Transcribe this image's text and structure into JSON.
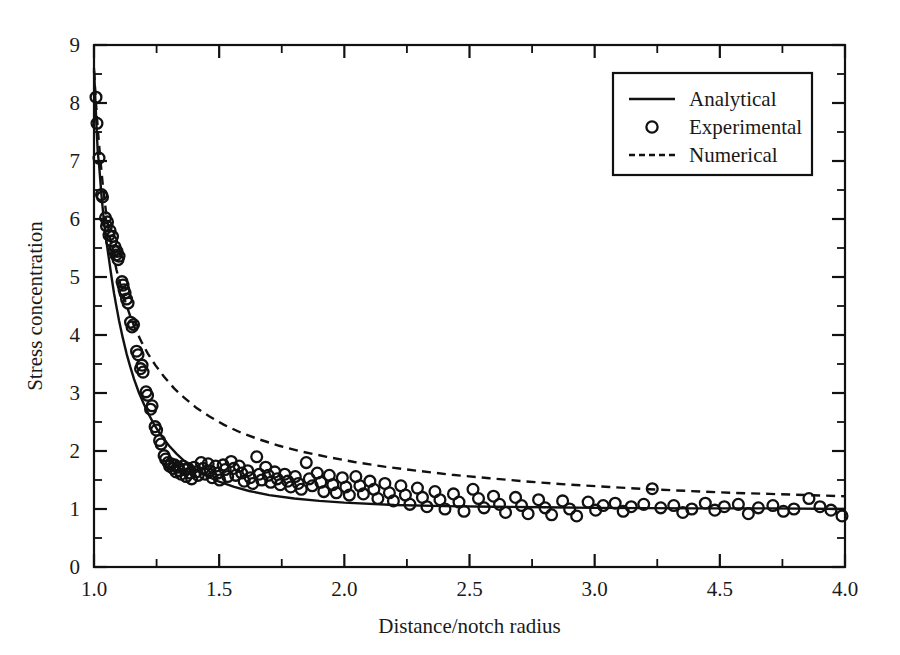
{
  "figure": {
    "background_color": "#ffffff",
    "ink_color": "#111111"
  },
  "chart_data": {
    "type": "scatter",
    "title": "",
    "subtitle": "",
    "xlabel": "Distance/notch radius",
    "ylabel": "Stress concentration",
    "xlim": [
      1.0,
      4.0
    ],
    "ylim": [
      0,
      9
    ],
    "grid": false,
    "legend_position": "top-right",
    "x_ticks": [
      1.0,
      1.5,
      2.0,
      2.5,
      3.0,
      3.5,
      4.0
    ],
    "x_tick_labels": [
      "1.0",
      "1.5",
      "2.0",
      "2.5",
      "3.0",
      "4.5",
      "4.0"
    ],
    "x_minor_tick_step": 0.25,
    "y_ticks": [
      0,
      1,
      2,
      3,
      4,
      5,
      6,
      7,
      8,
      9
    ],
    "y_tick_labels": [
      "0",
      "1",
      "2",
      "3",
      "4",
      "5",
      "6",
      "7",
      "8",
      "9"
    ],
    "y_minor_tick_step": 0.5,
    "annotations": [
      "X tick label at position 3.5 is printed as 4.5 in the original figure"
    ],
    "series": [
      {
        "name": "Analytical",
        "style": "solid-line",
        "marker": "none",
        "asymptote": 1.0,
        "points": [
          [
            1.0,
            8.6
          ],
          [
            1.005,
            8.1
          ],
          [
            1.01,
            7.6
          ],
          [
            1.015,
            7.15
          ],
          [
            1.02,
            6.95
          ],
          [
            1.03,
            6.4
          ],
          [
            1.04,
            5.95
          ],
          [
            1.05,
            5.6
          ],
          [
            1.06,
            5.3
          ],
          [
            1.07,
            5.0
          ],
          [
            1.08,
            4.72
          ],
          [
            1.09,
            4.48
          ],
          [
            1.1,
            4.25
          ],
          [
            1.115,
            3.95
          ],
          [
            1.13,
            3.68
          ],
          [
            1.145,
            3.45
          ],
          [
            1.16,
            3.24
          ],
          [
            1.18,
            3.0
          ],
          [
            1.2,
            2.8
          ],
          [
            1.22,
            2.62
          ],
          [
            1.24,
            2.46
          ],
          [
            1.26,
            2.32
          ],
          [
            1.28,
            2.2
          ],
          [
            1.3,
            2.09
          ],
          [
            1.33,
            1.95
          ],
          [
            1.36,
            1.83
          ],
          [
            1.4,
            1.7
          ],
          [
            1.45,
            1.57
          ],
          [
            1.5,
            1.47
          ],
          [
            1.56,
            1.38
          ],
          [
            1.62,
            1.31
          ],
          [
            1.7,
            1.24
          ],
          [
            1.8,
            1.18
          ],
          [
            1.9,
            1.14
          ],
          [
            2.0,
            1.11
          ],
          [
            2.2,
            1.07
          ],
          [
            2.4,
            1.05
          ],
          [
            2.6,
            1.04
          ],
          [
            2.8,
            1.03
          ],
          [
            3.0,
            1.02
          ],
          [
            3.4,
            1.01
          ],
          [
            3.7,
            1.01
          ],
          [
            4.0,
            1.0
          ]
        ]
      },
      {
        "name": "Numerical",
        "style": "dashed-line",
        "marker": "none",
        "asymptote": 1.2,
        "points": [
          [
            1.0,
            8.55
          ],
          [
            1.008,
            8.0
          ],
          [
            1.016,
            7.5
          ],
          [
            1.026,
            7.0
          ],
          [
            1.036,
            6.55
          ],
          [
            1.048,
            6.12
          ],
          [
            1.06,
            5.78
          ],
          [
            1.074,
            5.45
          ],
          [
            1.09,
            5.12
          ],
          [
            1.105,
            4.88
          ],
          [
            1.125,
            4.58
          ],
          [
            1.145,
            4.32
          ],
          [
            1.165,
            4.1
          ],
          [
            1.19,
            3.88
          ],
          [
            1.215,
            3.68
          ],
          [
            1.245,
            3.48
          ],
          [
            1.28,
            3.28
          ],
          [
            1.32,
            3.08
          ],
          [
            1.36,
            2.92
          ],
          [
            1.41,
            2.74
          ],
          [
            1.46,
            2.6
          ],
          [
            1.52,
            2.45
          ],
          [
            1.59,
            2.31
          ],
          [
            1.66,
            2.2
          ],
          [
            1.74,
            2.09
          ],
          [
            1.83,
            1.99
          ],
          [
            1.93,
            1.9
          ],
          [
            2.04,
            1.81
          ],
          [
            2.16,
            1.73
          ],
          [
            2.29,
            1.66
          ],
          [
            2.43,
            1.59
          ],
          [
            2.58,
            1.53
          ],
          [
            2.74,
            1.47
          ],
          [
            2.9,
            1.42
          ],
          [
            3.06,
            1.38
          ],
          [
            3.22,
            1.34
          ],
          [
            3.38,
            1.31
          ],
          [
            3.54,
            1.28
          ],
          [
            3.7,
            1.26
          ],
          [
            3.85,
            1.24
          ],
          [
            4.0,
            1.22
          ]
        ]
      },
      {
        "name": "Experimental",
        "style": "none",
        "marker": "open-circle",
        "points": [
          [
            1.008,
            8.1
          ],
          [
            1.012,
            7.65
          ],
          [
            1.02,
            7.05
          ],
          [
            1.03,
            6.42
          ],
          [
            1.034,
            6.38
          ],
          [
            1.046,
            6.02
          ],
          [
            1.05,
            5.88
          ],
          [
            1.054,
            5.95
          ],
          [
            1.06,
            5.72
          ],
          [
            1.064,
            5.8
          ],
          [
            1.07,
            5.62
          ],
          [
            1.074,
            5.7
          ],
          [
            1.08,
            5.45
          ],
          [
            1.084,
            5.52
          ],
          [
            1.088,
            5.38
          ],
          [
            1.092,
            5.44
          ],
          [
            1.096,
            5.3
          ],
          [
            1.1,
            5.36
          ],
          [
            1.112,
            4.92
          ],
          [
            1.116,
            4.86
          ],
          [
            1.12,
            4.78
          ],
          [
            1.124,
            4.72
          ],
          [
            1.13,
            4.62
          ],
          [
            1.136,
            4.55
          ],
          [
            1.146,
            4.22
          ],
          [
            1.152,
            4.14
          ],
          [
            1.158,
            4.18
          ],
          [
            1.17,
            3.72
          ],
          [
            1.176,
            3.66
          ],
          [
            1.186,
            3.42
          ],
          [
            1.192,
            3.48
          ],
          [
            1.196,
            3.36
          ],
          [
            1.208,
            3.02
          ],
          [
            1.214,
            2.96
          ],
          [
            1.226,
            2.72
          ],
          [
            1.232,
            2.78
          ],
          [
            1.244,
            2.42
          ],
          [
            1.25,
            2.36
          ],
          [
            1.262,
            2.18
          ],
          [
            1.268,
            2.12
          ],
          [
            1.28,
            1.92
          ],
          [
            1.286,
            1.86
          ],
          [
            1.296,
            1.8
          ],
          [
            1.302,
            1.74
          ],
          [
            1.308,
            1.78
          ],
          [
            1.316,
            1.7
          ],
          [
            1.322,
            1.76
          ],
          [
            1.328,
            1.64
          ],
          [
            1.336,
            1.72
          ],
          [
            1.342,
            1.66
          ],
          [
            1.348,
            1.6
          ],
          [
            1.356,
            1.74
          ],
          [
            1.362,
            1.68
          ],
          [
            1.368,
            1.56
          ],
          [
            1.376,
            1.7
          ],
          [
            1.382,
            1.62
          ],
          [
            1.39,
            1.52
          ],
          [
            1.4,
            1.72
          ],
          [
            1.408,
            1.64
          ],
          [
            1.416,
            1.58
          ],
          [
            1.428,
            1.8
          ],
          [
            1.436,
            1.7
          ],
          [
            1.444,
            1.6
          ],
          [
            1.456,
            1.78
          ],
          [
            1.464,
            1.66
          ],
          [
            1.472,
            1.54
          ],
          [
            1.486,
            1.74
          ],
          [
            1.494,
            1.62
          ],
          [
            1.502,
            1.5
          ],
          [
            1.516,
            1.76
          ],
          [
            1.524,
            1.68
          ],
          [
            1.534,
            1.56
          ],
          [
            1.548,
            1.82
          ],
          [
            1.558,
            1.7
          ],
          [
            1.566,
            1.58
          ],
          [
            1.58,
            1.74
          ],
          [
            1.59,
            1.62
          ],
          [
            1.6,
            1.48
          ],
          [
            1.614,
            1.66
          ],
          [
            1.624,
            1.54
          ],
          [
            1.634,
            1.44
          ],
          [
            1.65,
            1.9
          ],
          [
            1.66,
            1.6
          ],
          [
            1.67,
            1.5
          ],
          [
            1.686,
            1.72
          ],
          [
            1.696,
            1.58
          ],
          [
            1.706,
            1.46
          ],
          [
            1.722,
            1.64
          ],
          [
            1.732,
            1.52
          ],
          [
            1.744,
            1.42
          ],
          [
            1.762,
            1.6
          ],
          [
            1.774,
            1.48
          ],
          [
            1.786,
            1.38
          ],
          [
            1.804,
            1.56
          ],
          [
            1.816,
            1.44
          ],
          [
            1.828,
            1.34
          ],
          [
            1.848,
            1.8
          ],
          [
            1.86,
            1.52
          ],
          [
            1.872,
            1.4
          ],
          [
            1.892,
            1.62
          ],
          [
            1.906,
            1.46
          ],
          [
            1.918,
            1.3
          ],
          [
            1.94,
            1.58
          ],
          [
            1.954,
            1.42
          ],
          [
            1.968,
            1.28
          ],
          [
            1.992,
            1.54
          ],
          [
            2.006,
            1.38
          ],
          [
            2.02,
            1.24
          ],
          [
            2.046,
            1.56
          ],
          [
            2.062,
            1.4
          ],
          [
            2.076,
            1.26
          ],
          [
            2.102,
            1.48
          ],
          [
            2.118,
            1.34
          ],
          [
            2.134,
            1.18
          ],
          [
            2.162,
            1.44
          ],
          [
            2.18,
            1.28
          ],
          [
            2.196,
            1.14
          ],
          [
            2.226,
            1.4
          ],
          [
            2.244,
            1.24
          ],
          [
            2.262,
            1.08
          ],
          [
            2.292,
            1.36
          ],
          [
            2.312,
            1.2
          ],
          [
            2.33,
            1.04
          ],
          [
            2.362,
            1.3
          ],
          [
            2.382,
            1.16
          ],
          [
            2.402,
            1.0
          ],
          [
            2.436,
            1.26
          ],
          [
            2.458,
            1.12
          ],
          [
            2.478,
            0.96
          ],
          [
            2.514,
            1.34
          ],
          [
            2.536,
            1.18
          ],
          [
            2.558,
            1.02
          ],
          [
            2.596,
            1.22
          ],
          [
            2.62,
            1.08
          ],
          [
            2.644,
            0.94
          ],
          [
            2.684,
            1.2
          ],
          [
            2.708,
            1.06
          ],
          [
            2.734,
            0.92
          ],
          [
            2.776,
            1.16
          ],
          [
            2.802,
            1.02
          ],
          [
            2.828,
            0.9
          ],
          [
            2.872,
            1.14
          ],
          [
            2.9,
            1.0
          ],
          [
            2.928,
            0.88
          ],
          [
            2.974,
            1.12
          ],
          [
            3.004,
            0.98
          ],
          [
            3.034,
            1.06
          ],
          [
            3.082,
            1.1
          ],
          [
            3.114,
            0.96
          ],
          [
            3.146,
            1.04
          ],
          [
            3.196,
            1.08
          ],
          [
            3.23,
            1.35
          ],
          [
            3.264,
            1.02
          ],
          [
            3.316,
            1.06
          ],
          [
            3.352,
            0.94
          ],
          [
            3.388,
            1.0
          ],
          [
            3.442,
            1.1
          ],
          [
            3.48,
            0.98
          ],
          [
            3.518,
            1.04
          ],
          [
            3.574,
            1.08
          ],
          [
            3.614,
            0.92
          ],
          [
            3.654,
            1.02
          ],
          [
            3.712,
            1.06
          ],
          [
            3.754,
            0.96
          ],
          [
            3.796,
            1.0
          ],
          [
            3.856,
            1.18
          ],
          [
            3.9,
            1.04
          ],
          [
            3.944,
            0.98
          ],
          [
            3.988,
            0.88
          ]
        ]
      }
    ]
  },
  "legend": {
    "entries": [
      {
        "label": "Analytical",
        "style": "solid-line"
      },
      {
        "label": "Experimental",
        "style": "open-circle"
      },
      {
        "label": "Numerical",
        "style": "dashed-line"
      }
    ]
  }
}
